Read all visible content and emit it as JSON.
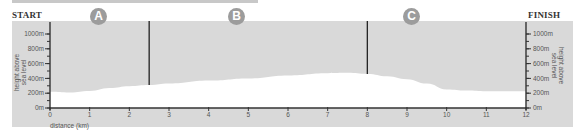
{
  "labels": {
    "start": "START",
    "finish": "FINISH",
    "sections": [
      "A",
      "B",
      "C"
    ],
    "xlabel": "distance (km)",
    "ylabel_left_line1": "height above",
    "ylabel_left_line2": "sea level",
    "ylabel_right_line1": "height above",
    "ylabel_right_line2": "sea level"
  },
  "colors": {
    "band": "#d9d9d9",
    "profile_fill": "#ffffff",
    "axis": "#333333",
    "badge": "#9c9c9c"
  },
  "chart_data": {
    "type": "area",
    "title": "",
    "xlabel": "distance (km)",
    "ylabel": "height above sea level",
    "x": [
      0,
      0.5,
      1,
      1.5,
      2,
      2.5,
      3,
      4,
      5,
      6,
      7,
      7.5,
      8,
      8.5,
      9,
      9.5,
      10,
      10.5,
      11,
      11.5,
      12
    ],
    "series": [
      {
        "name": "elevation (m)",
        "values": [
          220,
          210,
          230,
          270,
          295,
          310,
          330,
          370,
          400,
          440,
          470,
          475,
          460,
          430,
          390,
          330,
          250,
          235,
          225,
          225,
          225
        ]
      }
    ],
    "xlim": [
      0,
      12
    ],
    "ylim": [
      0,
      1000
    ],
    "x_ticks": [
      0,
      1,
      2,
      3,
      4,
      5,
      6,
      7,
      8,
      9,
      10,
      11,
      12
    ],
    "y_ticks": [
      "0m",
      "200m",
      "400m",
      "600m",
      "800m",
      "1000m"
    ],
    "section_dividers_km": [
      2.5,
      8
    ],
    "sections": [
      {
        "label": "A",
        "from_km": 0,
        "to_km": 2.5
      },
      {
        "label": "B",
        "from_km": 2.5,
        "to_km": 8
      },
      {
        "label": "C",
        "from_km": 8,
        "to_km": 12
      }
    ],
    "grid": false,
    "legend": "none"
  }
}
